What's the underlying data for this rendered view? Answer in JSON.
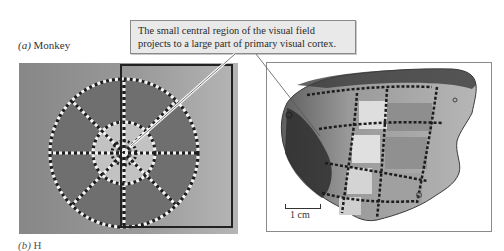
{
  "panel_a": {
    "letter": "(a)",
    "species": "Monkey"
  },
  "panel_b": {
    "letter": "(b)",
    "species": "H"
  },
  "callout": {
    "line1": "The small central region of the visual field",
    "line2": "projects to a large part of primary visual cortex."
  },
  "scale": {
    "label": "1 cm"
  },
  "colors": {
    "field_background": "#9a9a9a",
    "outer_ring": "#6e6e6e",
    "inner_disc": "#c4c4c4",
    "frame_border": "#8a8a8a",
    "callout_bg": "#e9e9e9"
  }
}
